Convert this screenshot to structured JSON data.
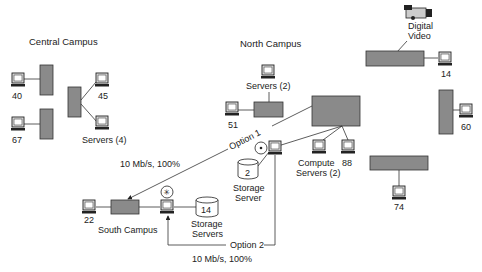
{
  "regions": {
    "central": "Central Campus",
    "north": "North Campus",
    "south": "South Campus"
  },
  "nodes": {
    "c40": "40",
    "c67": "67",
    "c45": "45",
    "c_servers": "Servers (4)",
    "n_servers": "Servers (2)",
    "n51": "51",
    "n14": "14",
    "n60": "60",
    "n74": "74",
    "n88": "88",
    "compute1": "Compute",
    "compute2": "Servers (2)",
    "storage_num": "2",
    "storage1": "Storage",
    "storage2": "Server",
    "video1": "Digital",
    "video2": "Video",
    "s22": "22",
    "s_storage_num": "14",
    "s_storage1": "Storage",
    "s_storage2": "Servers"
  },
  "links": {
    "option1": "Option 1",
    "option1_rate": "10 Mb/s, 100%",
    "option2": "Option 2",
    "option2_rate": "10 Mb/s, 100%"
  },
  "colors": {
    "switch_fill": "#8a8a8a",
    "line": "#333333"
  }
}
